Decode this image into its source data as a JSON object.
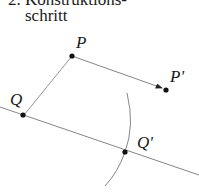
{
  "caption": {
    "line1": "2. Konstruktions-",
    "line2": "schritt"
  },
  "points": {
    "P": "P",
    "P_prime": "P'",
    "Q": "Q",
    "Q_prime": "Q'"
  },
  "colors": {
    "line": "#777777",
    "point": "#111111",
    "text": "#1a1a1a"
  }
}
